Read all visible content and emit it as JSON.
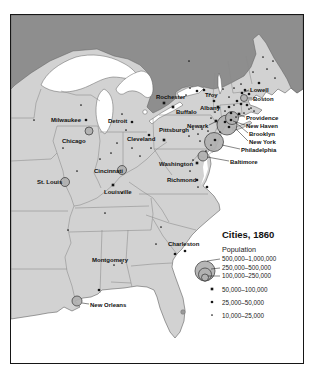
{
  "map": {
    "colors": {
      "land": "#d2d2d2",
      "canada": "#8e8e8e",
      "water": "#ffffff",
      "coast": "#5f5f5f",
      "stateline": "#8a8a8a",
      "marker_fill": "#b0b0b0",
      "marker_stroke": "#333333",
      "dot": "#161616"
    },
    "legend": {
      "title": "Cities, 1860",
      "subtitle": "Population",
      "circles": [
        {
          "label": "500,000–1,000,000",
          "r": 10
        },
        {
          "label": "250,000–500,000",
          "r": 6.5
        },
        {
          "label": "100,000–250,000",
          "r": 3.5
        }
      ],
      "dots": [
        {
          "label": "50,000–100,000",
          "cat": "sq"
        },
        {
          "label": "25,000–50,000",
          "cat": "d2"
        },
        {
          "label": "10,000–25,000",
          "cat": "d3"
        }
      ]
    },
    "cities": [
      {
        "name": "Milwaukee",
        "cat": "d2",
        "mx": 85,
        "my": 119,
        "lx": 50,
        "ly": 121
      },
      {
        "name": "Chicago",
        "cat": "c3",
        "r": 4,
        "mx": 88,
        "my": 130,
        "lx": 61,
        "ly": 142
      },
      {
        "name": "Detroit",
        "cat": "d2",
        "mx": 131,
        "my": 121,
        "lx": 107,
        "ly": 122
      },
      {
        "name": "Cleveland",
        "cat": "d2",
        "mx": 148,
        "my": 134,
        "lx": 126,
        "ly": 140
      },
      {
        "name": "Pittsburgh",
        "cat": "sq",
        "mx": 163,
        "my": 139,
        "lx": 158,
        "ly": 131
      },
      {
        "name": "Cincinnati",
        "cat": "c3",
        "r": 4.5,
        "mx": 121,
        "my": 169,
        "lx": 93,
        "ly": 172
      },
      {
        "name": "St. Louis",
        "cat": "c3",
        "r": 4.5,
        "mx": 64,
        "my": 181,
        "lx": 36,
        "ly": 183
      },
      {
        "name": "Louisville",
        "cat": "sq",
        "mx": 112,
        "my": 184,
        "lx": 103,
        "ly": 193
      },
      {
        "name": "Rochester",
        "cat": "sq",
        "mx": 163,
        "my": 102,
        "lx": 155,
        "ly": 98
      },
      {
        "name": "Buffalo",
        "cat": "sq",
        "mx": 172,
        "my": 106,
        "lx": 175,
        "ly": 113
      },
      {
        "name": "Troy",
        "cat": "d2",
        "mx": 213,
        "my": 100,
        "lx": 204,
        "ly": 96
      },
      {
        "name": "Albany",
        "cat": "sq",
        "mx": 217,
        "my": 106,
        "lx": 199,
        "ly": 109
      },
      {
        "name": "Lowell",
        "cat": "d2",
        "mx": 241,
        "my": 92,
        "lx": 249,
        "ly": 91,
        "leader": [
          248,
          89,
          243,
          91
        ]
      },
      {
        "name": "Boston",
        "cat": "c3",
        "r": 3.5,
        "mx": 243,
        "my": 97,
        "lx": 252,
        "ly": 100,
        "leader": [
          251,
          97,
          247,
          97
        ]
      },
      {
        "name": "Providence",
        "cat": "sq",
        "mx": 238,
        "my": 113,
        "lx": 245,
        "ly": 119,
        "leader": [
          244,
          116,
          239,
          114
        ]
      },
      {
        "name": "New Haven",
        "cat": "d2",
        "mx": 230,
        "my": 119,
        "lx": 245,
        "ly": 127,
        "leader": [
          244,
          124,
          232,
          120
        ]
      },
      {
        "name": "Newark",
        "cat": "sq",
        "mx": 215,
        "my": 120,
        "lx": 186,
        "ly": 127,
        "leader": [
          208,
          124,
          214,
          121
        ]
      },
      {
        "name": "Brooklyn",
        "cat": "c2",
        "r": 6.5,
        "mx": 231,
        "my": 117,
        "lx": 248,
        "ly": 135,
        "leader": [
          247,
          132,
          234,
          121
        ]
      },
      {
        "name": "New York",
        "cat": "c1",
        "r": 10,
        "mx": 226,
        "my": 124,
        "lx": 248,
        "ly": 143,
        "leader": [
          247,
          140,
          235,
          128
        ]
      },
      {
        "name": "Philadelphia",
        "cat": "c1",
        "r": 9.5,
        "mx": 213,
        "my": 141,
        "lx": 240,
        "ly": 151,
        "leader": [
          239,
          148,
          221,
          144
        ]
      },
      {
        "name": "Baltimore",
        "cat": "c3",
        "r": 5,
        "mx": 202,
        "my": 155,
        "lx": 229,
        "ly": 163,
        "leader": [
          228,
          160,
          206,
          156
        ]
      },
      {
        "name": "Washington",
        "cat": "sq",
        "mx": 196,
        "my": 162,
        "lx": 158,
        "ly": 165
      },
      {
        "name": "Richmond",
        "cat": "d2",
        "mx": 196,
        "my": 179,
        "lx": 166,
        "ly": 181
      },
      {
        "name": "Charleston",
        "cat": "d2",
        "mx": 184,
        "my": 250,
        "lx": 167,
        "ly": 245
      },
      {
        "name": "Montgomery",
        "cat": "d3",
        "mx": 113,
        "my": 264,
        "lx": 91,
        "ly": 261
      },
      {
        "name": "New Orleans",
        "cat": "c3",
        "r": 5,
        "mx": 76,
        "my": 300,
        "lx": 89,
        "ly": 306,
        "leader": [
          88,
          303,
          81,
          302
        ]
      }
    ],
    "unlabeled_dots": [
      [
        258,
        82,
        "d2"
      ],
      [
        266,
        68,
        "d3"
      ],
      [
        272,
        60,
        "d3"
      ],
      [
        274,
        77,
        "d3"
      ],
      [
        262,
        56,
        "d3"
      ],
      [
        252,
        71,
        "d3"
      ],
      [
        233,
        87,
        "d3"
      ],
      [
        240,
        83,
        "d3"
      ],
      [
        228,
        96,
        "d3"
      ],
      [
        222,
        88,
        "d3"
      ],
      [
        236,
        100,
        "d2"
      ],
      [
        240,
        103,
        "d2"
      ],
      [
        233,
        104,
        "d3"
      ],
      [
        246,
        104,
        "d2"
      ],
      [
        250,
        107,
        "d3"
      ],
      [
        244,
        89,
        "d2"
      ],
      [
        248,
        93,
        "d2"
      ],
      [
        228,
        106,
        "d2"
      ],
      [
        230,
        112,
        "d2"
      ],
      [
        235,
        116,
        "d3"
      ],
      [
        243,
        112,
        "d3"
      ],
      [
        253,
        110,
        "d3"
      ],
      [
        224,
        110,
        "d3"
      ],
      [
        248,
        108,
        "d3"
      ],
      [
        196,
        90,
        "d2"
      ],
      [
        203,
        89,
        "d2"
      ],
      [
        189,
        87,
        "d3"
      ],
      [
        185,
        94,
        "d3"
      ],
      [
        188,
        60,
        "d3"
      ],
      [
        209,
        93,
        "d3"
      ],
      [
        214,
        111,
        "d3"
      ],
      [
        210,
        117,
        "d3"
      ],
      [
        197,
        133,
        "d3"
      ],
      [
        192,
        128,
        "d3"
      ],
      [
        201,
        128,
        "d3"
      ],
      [
        199,
        140,
        "d3"
      ],
      [
        188,
        135,
        "d3"
      ],
      [
        207,
        130,
        "d3"
      ],
      [
        224,
        121,
        "d2"
      ],
      [
        228,
        126,
        "d2"
      ],
      [
        219,
        131,
        "d3"
      ],
      [
        214,
        139,
        "d2"
      ],
      [
        210,
        144,
        "d3"
      ],
      [
        205,
        150,
        "d3"
      ],
      [
        192,
        159,
        "d3"
      ],
      [
        206,
        186,
        "d2"
      ],
      [
        197,
        186,
        "d3"
      ],
      [
        189,
        170,
        "d3"
      ],
      [
        116,
        142,
        "d3"
      ],
      [
        110,
        152,
        "d3"
      ],
      [
        125,
        129,
        "d3"
      ],
      [
        131,
        147,
        "d3"
      ],
      [
        139,
        155,
        "d3"
      ],
      [
        150,
        147,
        "d3"
      ],
      [
        99,
        158,
        "d3"
      ],
      [
        121,
        113,
        "d3"
      ],
      [
        80,
        104,
        "d3"
      ],
      [
        33,
        119,
        "d3"
      ],
      [
        62,
        147,
        "d3"
      ],
      [
        76,
        170,
        "d3"
      ],
      [
        104,
        212,
        "d3"
      ],
      [
        67,
        229,
        "d3"
      ],
      [
        121,
        192,
        "d3"
      ],
      [
        155,
        243,
        "d3"
      ],
      [
        174,
        253,
        "d2"
      ],
      [
        98,
        289,
        "d2"
      ],
      [
        121,
        262,
        "d3"
      ],
      [
        160,
        226,
        "d3"
      ]
    ]
  }
}
